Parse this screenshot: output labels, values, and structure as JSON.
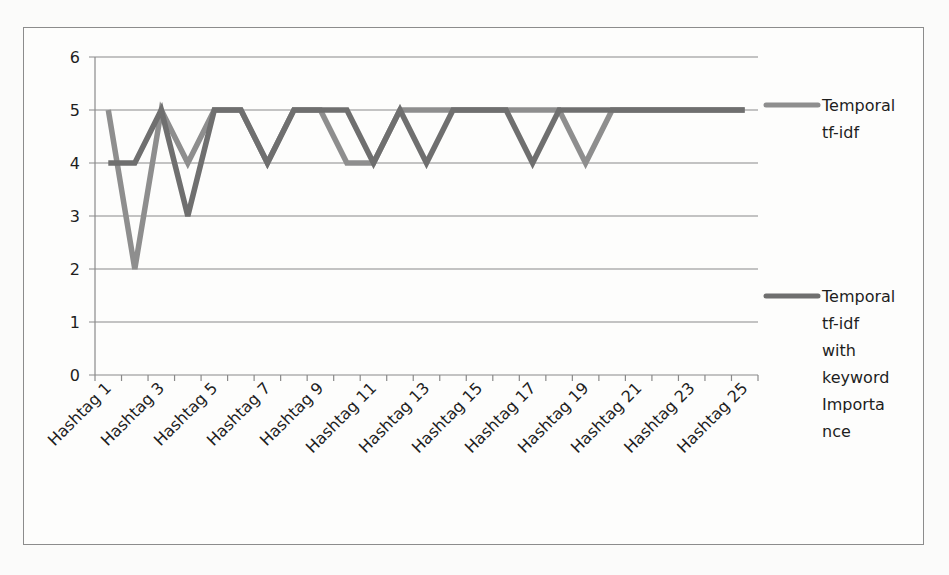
{
  "chart_data": {
    "type": "line",
    "title": "",
    "xlabel": "",
    "ylabel": "",
    "ylim": [
      0,
      6
    ],
    "yticks": [
      0,
      1,
      2,
      3,
      4,
      5,
      6
    ],
    "grid": true,
    "legend_position": "right",
    "categories": [
      "Hashtag 1",
      "Hashtag 2",
      "Hashtag 3",
      "Hashtag 4",
      "Hashtag 5",
      "Hashtag 6",
      "Hashtag 7",
      "Hashtag 8",
      "Hashtag 9",
      "Hashtag 10",
      "Hashtag 11",
      "Hashtag 12",
      "Hashtag 13",
      "Hashtag 14",
      "Hashtag 15",
      "Hashtag 16",
      "Hashtag 17",
      "Hashtag 18",
      "Hashtag 19",
      "Hashtag 20",
      "Hashtag 21",
      "Hashtag 22",
      "Hashtag 23",
      "Hashtag 24",
      "Hashtag 25"
    ],
    "visible_tick_labels": [
      "Hashtag 1",
      "Hashtag 3",
      "Hashtag 5",
      "Hashtag 7",
      "Hashtag 9",
      "Hashtag 11",
      "Hashtag 13",
      "Hashtag 15",
      "Hashtag 17",
      "Hashtag 19",
      "Hashtag 21",
      "Hashtag 23",
      "Hashtag 25"
    ],
    "series": [
      {
        "name": "Temporal tf-idf",
        "legend_lines": [
          "Temporal",
          "tf-idf"
        ],
        "color": "#8e8e8e",
        "values": [
          5,
          2,
          5,
          4,
          5,
          5,
          4,
          5,
          5,
          4,
          4,
          5,
          5,
          5,
          5,
          5,
          5,
          5,
          4,
          5,
          5,
          5,
          5,
          5,
          5
        ]
      },
      {
        "name": "Temporal tf-idf with keyword Importance",
        "legend_lines": [
          "Temporal",
          "tf-idf",
          "with",
          "keyword",
          "Importa",
          "nce"
        ],
        "color": "#6f6f6f",
        "values": [
          4,
          4,
          5,
          3,
          5,
          5,
          4,
          5,
          5,
          5,
          4,
          5,
          4,
          5,
          5,
          5,
          4,
          5,
          5,
          5,
          5,
          5,
          5,
          5,
          5
        ]
      }
    ]
  },
  "style": {
    "gridline_color": "#8a8a8a",
    "axis_color": "#8a8a8a",
    "frame_color": "#8c8c8c"
  }
}
